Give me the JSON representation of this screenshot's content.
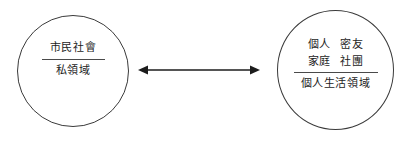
{
  "diagram": {
    "left_node": {
      "top_label": "市民社會",
      "bottom_label": "私領域"
    },
    "right_node": {
      "grid_labels": [
        "個人",
        "密友",
        "家庭",
        "社團"
      ],
      "bottom_label": "個人生活領域"
    },
    "connector": {
      "icon": "double-headed-arrow",
      "stroke_color": "#1c1c1c"
    },
    "colors": {
      "background": "#ffffff",
      "stroke": "#3a3a3a",
      "text": "#1c1c1c"
    }
  }
}
